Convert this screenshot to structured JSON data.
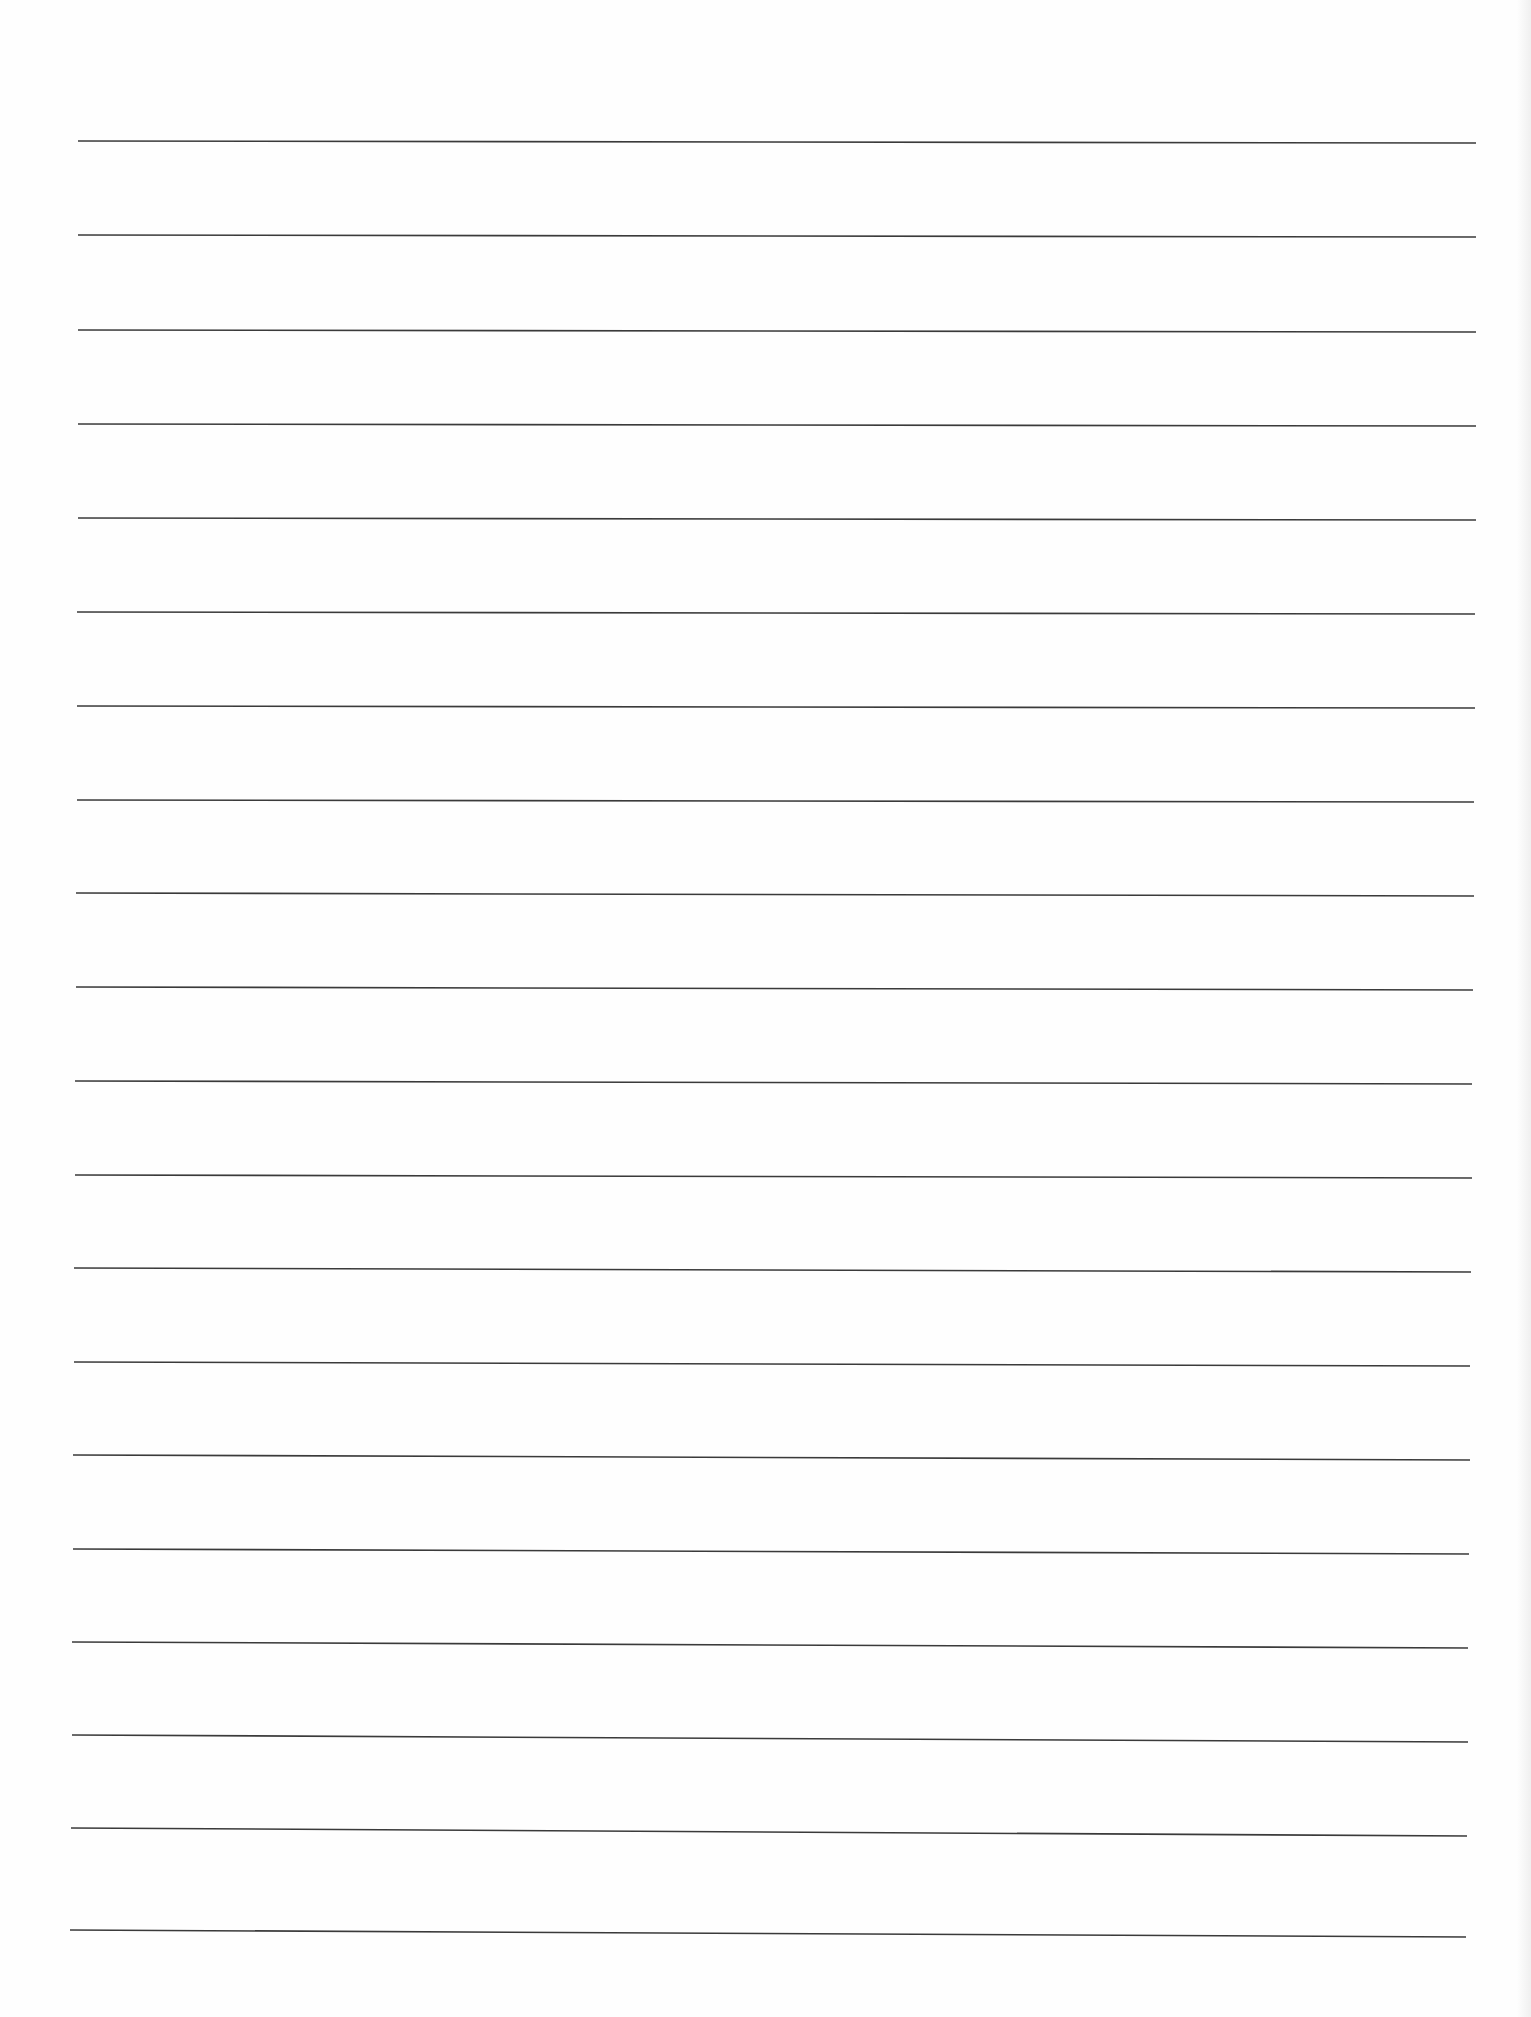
{
  "document": {
    "type": "lined-paper",
    "background_color": "#fefefe",
    "rule_color": "#3a3a3a",
    "rule_count": 20,
    "rules": [
      {
        "x1": 78,
        "y1": 141,
        "x2": 1476,
        "y2": 143
      },
      {
        "x1": 78,
        "y1": 235,
        "x2": 1476,
        "y2": 237
      },
      {
        "x1": 78,
        "y1": 330,
        "x2": 1476,
        "y2": 332
      },
      {
        "x1": 78,
        "y1": 424,
        "x2": 1476,
        "y2": 426
      },
      {
        "x1": 78,
        "y1": 518,
        "x2": 1476,
        "y2": 520
      },
      {
        "x1": 77,
        "y1": 612,
        "x2": 1475,
        "y2": 614
      },
      {
        "x1": 77,
        "y1": 706,
        "x2": 1475,
        "y2": 708
      },
      {
        "x1": 77,
        "y1": 800,
        "x2": 1474,
        "y2": 802
      },
      {
        "x1": 76,
        "y1": 893,
        "x2": 1474,
        "y2": 896
      },
      {
        "x1": 76,
        "y1": 987,
        "x2": 1473,
        "y2": 990
      },
      {
        "x1": 75,
        "y1": 1081,
        "x2": 1472,
        "y2": 1084
      },
      {
        "x1": 75,
        "y1": 1175,
        "x2": 1472,
        "y2": 1178
      },
      {
        "x1": 74,
        "y1": 1268,
        "x2": 1471,
        "y2": 1272
      },
      {
        "x1": 74,
        "y1": 1362,
        "x2": 1470,
        "y2": 1366
      },
      {
        "x1": 73,
        "y1": 1455,
        "x2": 1470,
        "y2": 1460
      },
      {
        "x1": 73,
        "y1": 1549,
        "x2": 1469,
        "y2": 1554
      },
      {
        "x1": 72,
        "y1": 1642,
        "x2": 1468,
        "y2": 1648
      },
      {
        "x1": 72,
        "y1": 1735,
        "x2": 1468,
        "y2": 1742
      },
      {
        "x1": 71,
        "y1": 1828,
        "x2": 1467,
        "y2": 1836
      },
      {
        "x1": 70,
        "y1": 1930,
        "x2": 1466,
        "y2": 1937
      }
    ]
  }
}
